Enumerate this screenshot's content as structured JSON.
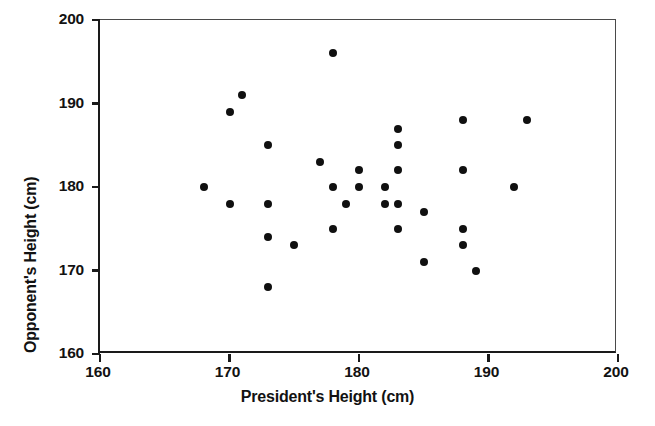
{
  "chart_data": {
    "type": "scatter",
    "title": "",
    "xlabel": "President's Height (cm)",
    "ylabel": "Opponent's Height (cm)",
    "xlim": [
      160,
      200
    ],
    "ylim": [
      160,
      200
    ],
    "xticks": [
      160,
      170,
      180,
      190,
      200
    ],
    "yticks": [
      160,
      170,
      180,
      190,
      200
    ],
    "xtick_labels": [
      "160",
      "170",
      "180",
      "190",
      "200"
    ],
    "ytick_labels": [
      "160",
      "170",
      "180",
      "190",
      "200"
    ],
    "grid": false,
    "legend": null,
    "marker": "filled-circle",
    "marker_color": "#101010",
    "marker_size": 8,
    "background_color": "#ffffff",
    "axis_color": "#1a1a1a",
    "n_points": 38,
    "points": [
      {
        "x": 168,
        "y": 180
      },
      {
        "x": 170,
        "y": 189
      },
      {
        "x": 170,
        "y": 178
      },
      {
        "x": 171,
        "y": 191
      },
      {
        "x": 173,
        "y": 185
      },
      {
        "x": 173,
        "y": 178
      },
      {
        "x": 173,
        "y": 174
      },
      {
        "x": 173,
        "y": 168
      },
      {
        "x": 175,
        "y": 173
      },
      {
        "x": 177,
        "y": 183
      },
      {
        "x": 178,
        "y": 196
      },
      {
        "x": 178,
        "y": 180
      },
      {
        "x": 178,
        "y": 175
      },
      {
        "x": 179,
        "y": 178
      },
      {
        "x": 180,
        "y": 182
      },
      {
        "x": 180,
        "y": 180
      },
      {
        "x": 182,
        "y": 180
      },
      {
        "x": 182,
        "y": 178
      },
      {
        "x": 183,
        "y": 187
      },
      {
        "x": 183,
        "y": 185
      },
      {
        "x": 183,
        "y": 182
      },
      {
        "x": 183,
        "y": 178
      },
      {
        "x": 183,
        "y": 175
      },
      {
        "x": 185,
        "y": 177
      },
      {
        "x": 185,
        "y": 171
      },
      {
        "x": 188,
        "y": 188
      },
      {
        "x": 188,
        "y": 182
      },
      {
        "x": 188,
        "y": 175
      },
      {
        "x": 188,
        "y": 173
      },
      {
        "x": 189,
        "y": 170
      },
      {
        "x": 192,
        "y": 180
      },
      {
        "x": 193,
        "y": 188
      }
    ]
  }
}
